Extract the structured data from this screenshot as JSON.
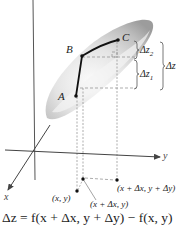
{
  "figure": {
    "type": "surface-increment-diagram",
    "axes": {
      "x_label": "x",
      "y_label": "y",
      "z_axis": "vertical"
    },
    "surface_points": {
      "A": "A",
      "B": "B",
      "C": "C"
    },
    "braces": {
      "dz2": "Δz",
      "dz2_sub": "2",
      "dz1": "Δz",
      "dz1_sub": "1",
      "dz_total": "Δz"
    },
    "domain_points": {
      "p1": "(x, y)",
      "p2": "(x + Δx, y)",
      "p3": "(x + Δx, y + Δy)"
    },
    "formula": "Δz = f(x + Δx, y + Δy) − f(x, y)"
  },
  "colors": {
    "surface_dark": "#9a9a9a",
    "surface_light": "#f2f2f2",
    "axis": "#444444",
    "path": "#111111",
    "dashed": "#888888"
  }
}
